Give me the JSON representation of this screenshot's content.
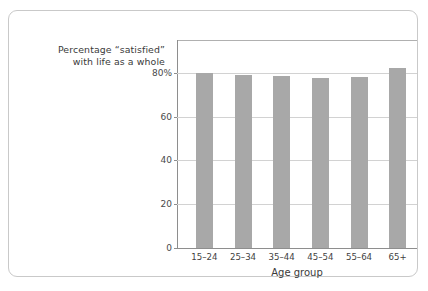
{
  "chart_data": {
    "type": "bar",
    "title": "Percentage “satisfied” with life as a whole",
    "title_lines": [
      "Percentage “satisfied”",
      "with life as a whole"
    ],
    "categories": [
      "15–24",
      "25–34",
      "35–44",
      "45–54",
      "55–64",
      "65+"
    ],
    "values": [
      80,
      79,
      78.5,
      77.5,
      78,
      82
    ],
    "xlabel": "Age group",
    "ylabel": "",
    "ylim": [
      0,
      95
    ],
    "yticks": [
      0,
      20,
      40,
      60,
      80
    ],
    "ytick_labels": [
      "0",
      "20",
      "40",
      "60",
      "80%"
    ],
    "grid": true,
    "legend": false,
    "bar_color": "#a8a8a8",
    "gridline_color": "#d2d2d2",
    "axis_color": "#8e8e8e",
    "border_color": "#c9c9c9"
  }
}
